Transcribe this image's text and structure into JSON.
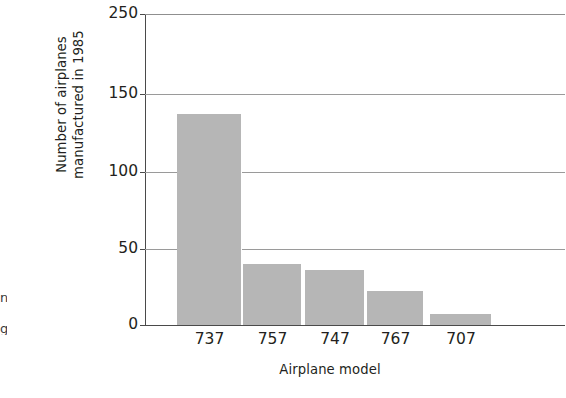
{
  "chart_data": {
    "type": "bar",
    "title": "",
    "xlabel": "Airplane model",
    "ylabel_line1": "Number of airplanes",
    "ylabel_line2": "manufactured in 1985",
    "categories": [
      "737",
      "757",
      "747",
      "767",
      "707"
    ],
    "values": [
      137,
      40,
      36,
      22,
      7
    ],
    "ytick_labels": [
      "0",
      "50",
      "100",
      "150",
      "250"
    ],
    "ytick_values": [
      0,
      50,
      100,
      150,
      250
    ],
    "ylim": [
      0,
      250
    ],
    "grid": "horizontal",
    "legend": "none",
    "bar_color": "#b6b6b6",
    "axis_color": "#4a4a4a",
    "grid_color": "#9a9a9a",
    "text_color": "#231f20"
  },
  "margin_fragments": {
    "glyph_top": "n",
    "glyph_bottom": "g"
  }
}
